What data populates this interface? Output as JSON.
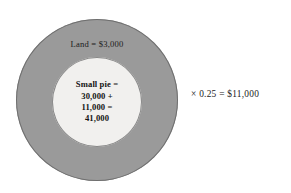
{
  "figure": {
    "type": "nested-circles-diagram",
    "background_color": "#ffffff",
    "outer_circle": {
      "name": "big-pie",
      "fill_color": "#9a9a9a",
      "stroke_color": "#6f6f6f",
      "label": "Land = $3,000"
    },
    "inner_circle": {
      "name": "small-pie",
      "fill_color": "#f1f0ee",
      "stroke_color": "#8a8a8a",
      "lines": [
        "Small pie =",
        "30,000 +",
        "11,000 =",
        "41,000"
      ]
    },
    "side_equation": "× 0.25 = $11,000"
  }
}
